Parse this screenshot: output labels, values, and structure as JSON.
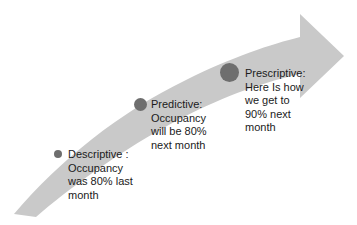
{
  "diagram": {
    "type": "curved-arrow-progression",
    "background_color": "#ffffff",
    "arrow_color": "#c9c9c9",
    "marker_color": "#6e6e6e",
    "text_color": "#1b1b1b",
    "stages": [
      {
        "id": "descriptive",
        "marker_name": "stage-marker-descriptive",
        "marker_size": "small",
        "label": "Descriptive :\nOccupancy\nwas 80% last\nmonth"
      },
      {
        "id": "predictive",
        "marker_name": "stage-marker-predictive",
        "marker_size": "medium",
        "label": "Predictive:\nOccupancy\nwill be 80%\nnext month"
      },
      {
        "id": "prescriptive",
        "marker_name": "stage-marker-prescriptive",
        "marker_size": "large",
        "label": "Prescriptive:\nHere Is how\nwe get to\n90% next\nmonth"
      }
    ]
  }
}
